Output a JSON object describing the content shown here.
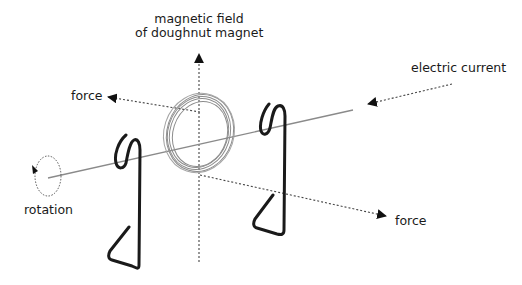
{
  "diagram": {
    "labels": {
      "magnetic_field_line1": "magnetic field",
      "magnetic_field_line2": "of doughnut magnet",
      "electric_current": "electric current",
      "force_left": "force",
      "force_right": "force",
      "rotation": "rotation"
    },
    "colors": {
      "text": "#1a1a1a",
      "axle": "#8a8a8a",
      "coil": "#8c8c8c",
      "wire_support": "#1a1a1a",
      "dotted_arrow": "#444444"
    },
    "components": [
      {
        "name": "doughnut-magnet",
        "description": "ring of coiled wire on the axle"
      },
      {
        "name": "left-wire-support",
        "description": "bent paperclip supporting axle"
      },
      {
        "name": "right-wire-support",
        "description": "bent paperclip supporting axle"
      },
      {
        "name": "axle",
        "description": "straight thin line through magnet"
      }
    ]
  }
}
